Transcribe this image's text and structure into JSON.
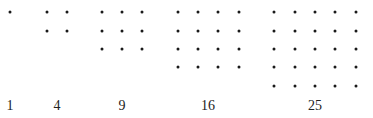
{
  "style": {
    "dot_color": "#1a1a1a",
    "label_color": "#222222",
    "background": "#ffffff"
  },
  "layout": {
    "row_y": [
      12,
      31,
      49,
      67,
      86
    ],
    "label_y": 97
  },
  "groups": [
    {
      "label": "1",
      "n": 1,
      "xs": [
        10
      ],
      "label_x": 10
    },
    {
      "label": "4",
      "n": 2,
      "xs": [
        47,
        67
      ],
      "label_x": 57
    },
    {
      "label": "9",
      "n": 3,
      "xs": [
        102,
        122,
        142
      ],
      "label_x": 122
    },
    {
      "label": "16",
      "n": 4,
      "xs": [
        178,
        198,
        218,
        239
      ],
      "label_x": 208
    },
    {
      "label": "25",
      "n": 5,
      "xs": [
        274,
        295,
        315,
        335,
        356
      ],
      "label_x": 315
    }
  ]
}
